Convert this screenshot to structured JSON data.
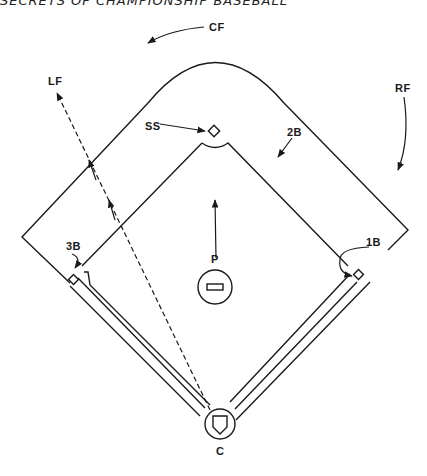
{
  "header": {
    "title": "SECRETS OF CHAMPIONSHIP BASEBALL"
  },
  "diagram": {
    "labels": {
      "cf": "CF",
      "lf": "LF",
      "rf": "RF",
      "ss": "SS",
      "second_base": "2B",
      "third_base": "3B",
      "first_base": "1B",
      "pitcher": "P",
      "catcher": "C"
    },
    "colors": {
      "ink": "#1a1a1a",
      "background": "#ffffff"
    }
  }
}
